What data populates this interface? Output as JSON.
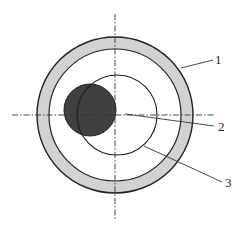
{
  "figure": {
    "type": "cross-section schematic",
    "center": {
      "x": 115,
      "y": 115
    },
    "colors": {
      "outline": "#222222",
      "ring_fill": "#d2d2d2",
      "solid_fill": "#404040",
      "background": "#ffffff"
    },
    "parts": [
      {
        "id": "1",
        "label": "1",
        "description": "outer annular ring (shaded)",
        "outer_radius": 78,
        "inner_radius": 66
      },
      {
        "id": "2",
        "label": "2",
        "description": "center point / axis",
        "x": 125,
        "y": 115
      },
      {
        "id": "3",
        "label": "3",
        "description": "inner concentric circle",
        "radius": 40
      },
      {
        "id": "dark",
        "label": "",
        "description": "offset dark solid circle",
        "cx": 90,
        "cy": 110,
        "radius": 26
      }
    ],
    "axes": {
      "horizontal": {
        "x1": 12,
        "x2": 214,
        "y": 115
      },
      "vertical": {
        "y1": 14,
        "y2": 221,
        "x": 115
      }
    },
    "labels": {
      "label_1": "1",
      "label_2": "2",
      "label_3": "3"
    }
  }
}
